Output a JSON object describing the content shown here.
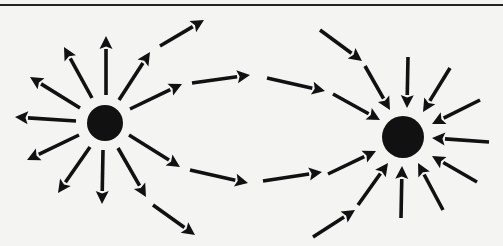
{
  "diagram": {
    "colors": {
      "background": "#f4f4f2",
      "ink": "#111111",
      "rule": "#222222"
    },
    "nodes": [
      {
        "id": "source",
        "role": "source",
        "cx": 105,
        "cy": 123,
        "r": 18
      },
      {
        "id": "sink",
        "role": "sink",
        "cx": 403,
        "cy": 137,
        "r": 21
      }
    ],
    "arrows": [
      {
        "group": "source-radial",
        "x1": 106,
        "y1": 95,
        "x2": 106,
        "y2": 36
      },
      {
        "group": "source-radial",
        "x1": 92,
        "y1": 98,
        "x2": 64,
        "y2": 47
      },
      {
        "group": "source-radial",
        "x1": 80,
        "y1": 108,
        "x2": 30,
        "y2": 77
      },
      {
        "group": "source-radial",
        "x1": 76,
        "y1": 121,
        "x2": 15,
        "y2": 117
      },
      {
        "group": "source-radial",
        "x1": 79,
        "y1": 135,
        "x2": 27,
        "y2": 160
      },
      {
        "group": "source-radial",
        "x1": 90,
        "y1": 147,
        "x2": 58,
        "y2": 193
      },
      {
        "group": "source-radial",
        "x1": 103,
        "y1": 150,
        "x2": 102,
        "y2": 204
      },
      {
        "group": "source-radial",
        "x1": 118,
        "y1": 148,
        "x2": 146,
        "y2": 197
      },
      {
        "group": "source-radial",
        "x1": 119,
        "y1": 100,
        "x2": 150,
        "y2": 52
      },
      {
        "group": "source-radial",
        "x1": 130,
        "y1": 109,
        "x2": 182,
        "y2": 84
      },
      {
        "group": "source-radial",
        "x1": 129,
        "y1": 135,
        "x2": 180,
        "y2": 167
      },
      {
        "group": "connecting",
        "x1": 160,
        "y1": 46,
        "x2": 204,
        "y2": 20
      },
      {
        "group": "connecting",
        "x1": 192,
        "y1": 83,
        "x2": 250,
        "y2": 75
      },
      {
        "group": "connecting",
        "x1": 190,
        "y1": 170,
        "x2": 248,
        "y2": 183
      },
      {
        "group": "connecting",
        "x1": 153,
        "y1": 205,
        "x2": 195,
        "y2": 235
      },
      {
        "group": "connecting",
        "x1": 267,
        "y1": 78,
        "x2": 325,
        "y2": 91
      },
      {
        "group": "connecting",
        "x1": 333,
        "y1": 94,
        "x2": 380,
        "y2": 120
      },
      {
        "group": "connecting",
        "x1": 320,
        "y1": 30,
        "x2": 362,
        "y2": 61
      },
      {
        "group": "connecting",
        "x1": 365,
        "y1": 66,
        "x2": 390,
        "y2": 110
      },
      {
        "group": "connecting",
        "x1": 263,
        "y1": 181,
        "x2": 322,
        "y2": 172
      },
      {
        "group": "connecting",
        "x1": 328,
        "y1": 174,
        "x2": 376,
        "y2": 151
      },
      {
        "group": "connecting",
        "x1": 313,
        "y1": 237,
        "x2": 355,
        "y2": 210
      },
      {
        "group": "connecting",
        "x1": 358,
        "y1": 205,
        "x2": 388,
        "y2": 163
      },
      {
        "group": "sink-radial",
        "x1": 408,
        "y1": 57,
        "x2": 407,
        "y2": 108
      },
      {
        "group": "sink-radial",
        "x1": 450,
        "y1": 68,
        "x2": 423,
        "y2": 112
      },
      {
        "group": "sink-radial",
        "x1": 480,
        "y1": 100,
        "x2": 432,
        "y2": 124
      },
      {
        "group": "sink-radial",
        "x1": 489,
        "y1": 142,
        "x2": 432,
        "y2": 138
      },
      {
        "group": "sink-radial",
        "x1": 477,
        "y1": 182,
        "x2": 432,
        "y2": 156
      },
      {
        "group": "sink-radial",
        "x1": 443,
        "y1": 210,
        "x2": 418,
        "y2": 163
      },
      {
        "group": "sink-radial",
        "x1": 401,
        "y1": 218,
        "x2": 402,
        "y2": 166
      }
    ]
  }
}
